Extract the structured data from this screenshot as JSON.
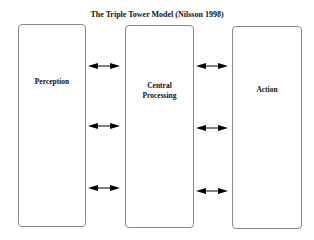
{
  "title": "The Triple Tower Model (Nilsson 1998)",
  "towers": [
    {
      "id": "perception",
      "label": "Perception"
    },
    {
      "id": "central-processing",
      "label_line1": "Central",
      "label_line2": "Processing"
    },
    {
      "id": "action",
      "label": "Action"
    }
  ],
  "arrows": {
    "left_gap": [
      "bidirectional",
      "bidirectional",
      "bidirectional"
    ],
    "right_gap": [
      "bidirectional",
      "bidirectional",
      "bidirectional"
    ]
  },
  "colors": {
    "border": "#8a8a8a",
    "arrow": "#000000",
    "text": "#111111"
  }
}
